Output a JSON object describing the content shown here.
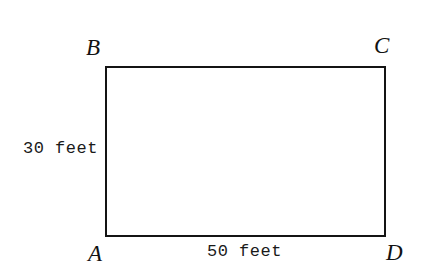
{
  "figure": {
    "kind": "rectangle-diagram",
    "shape_name": "rectangle-ABCD",
    "stroke_color": "#141414",
    "fill_color": "#ffffff",
    "background_color": "#ffffff",
    "vertices": [
      {
        "id": "B",
        "label": "B",
        "position": "top-left"
      },
      {
        "id": "C",
        "label": "C",
        "position": "top-right"
      },
      {
        "id": "A",
        "label": "A",
        "position": "bottom-left"
      },
      {
        "id": "D",
        "label": "D",
        "position": "bottom-right"
      }
    ],
    "dimensions": [
      {
        "id": "height",
        "label": "30 feet",
        "value": 30,
        "unit": "feet",
        "side": "AB-left"
      },
      {
        "id": "width",
        "label": "50 feet",
        "value": 50,
        "unit": "feet",
        "side": "AD-bottom"
      }
    ]
  }
}
